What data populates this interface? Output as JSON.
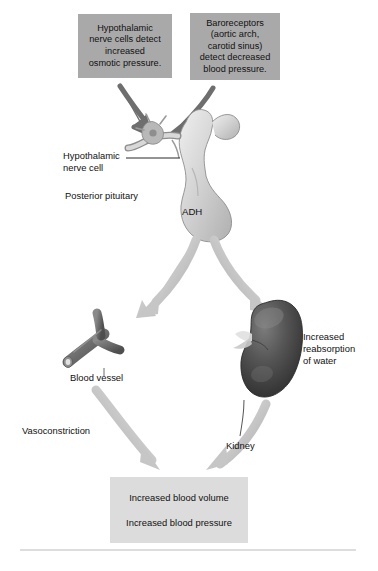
{
  "diagram": {
    "colors": {
      "stimulus_box_fill": "#a9a9a9",
      "outcome_box_fill": "#dcdcdc",
      "dark_arrow": "#6e6e6e",
      "light_arrow": "#c6c6c6",
      "kidney": "#4a4a4a",
      "blood_vessel": "#6b6b6b",
      "pituitary": "#cfcfcf",
      "text": "#111111",
      "rule": "#bbbbbb",
      "background": "#ffffff"
    }
  },
  "stimulus_boxes": {
    "hypothalamic": {
      "lines": [
        "Hypothalamic",
        "nerve cells detect",
        "increased",
        "osmotic pressure."
      ]
    },
    "baroreceptors": {
      "lines": [
        "Baroreceptors",
        "(aortic arch,",
        "carotid sinus)",
        "detect decreased",
        "blood pressure."
      ]
    }
  },
  "labels": {
    "hypothalamic_nerve_cell": [
      "Hypothalamic",
      "nerve cell"
    ],
    "posterior_pituitary": [
      "Posterior pituitary"
    ],
    "adh": [
      "ADH"
    ],
    "blood_vessel": [
      "Blood vessel"
    ],
    "kidney": [
      "Kidney"
    ],
    "increased_reabsorption": [
      "Increased",
      "reabsorption",
      "of water"
    ],
    "vasoconstriction": [
      "Vasoconstriction"
    ]
  },
  "outcome_box": {
    "lines": [
      "Increased blood volume",
      "Increased blood pressure"
    ]
  },
  "icons": {
    "arrow_stimulus_left": "down-right-arrow-icon",
    "arrow_stimulus_right": "down-left-arrow-icon",
    "arrow_to_vessel": "curved-down-left-arrow-icon",
    "arrow_to_kidney": "curved-down-right-arrow-icon",
    "arrow_vessel_to_outcome": "curved-down-right-arrow-icon",
    "arrow_kidney_to_outcome": "curved-down-left-arrow-icon",
    "pituitary": "pituitary-gland-icon",
    "kidney": "kidney-organ-icon",
    "blood_vessel": "blood-vessel-icon"
  }
}
